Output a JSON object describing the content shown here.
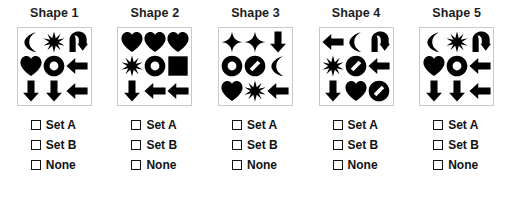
{
  "page": {
    "background_color": "#ffffff",
    "glyph_color": "#000000",
    "box_border_color": "#c9c9c9",
    "text_color": "#111111"
  },
  "option_labels": [
    "Set A",
    "Set B",
    "None"
  ],
  "columns": [
    {
      "title": "Shape 1",
      "glyphs": [
        "crescent-moon",
        "eight-point-star",
        "u-turn-arrow",
        "heart",
        "ring",
        "left-arrow",
        "down-arrow",
        "down-arrow",
        "left-arrow"
      ],
      "options": [
        {
          "label": "Set A",
          "checked": false
        },
        {
          "label": "Set B",
          "checked": false
        },
        {
          "label": "None",
          "checked": false
        }
      ]
    },
    {
      "title": "Shape 2",
      "glyphs": [
        "heart",
        "heart",
        "heart",
        "eight-point-star",
        "ring",
        "filled-square",
        "down-arrow",
        "left-arrow",
        "left-arrow"
      ],
      "options": [
        {
          "label": "Set A",
          "checked": false
        },
        {
          "label": "Set B",
          "checked": false
        },
        {
          "label": "None",
          "checked": false
        }
      ]
    },
    {
      "title": "Shape 3",
      "glyphs": [
        "four-point-sparkle",
        "four-point-sparkle",
        "down-arrow",
        "ring",
        "prohibition-sign",
        "crescent-moon",
        "heart",
        "eight-point-star",
        "left-arrow"
      ],
      "options": [
        {
          "label": "Set A",
          "checked": false
        },
        {
          "label": "Set B",
          "checked": false
        },
        {
          "label": "None",
          "checked": false
        }
      ]
    },
    {
      "title": "Shape 4",
      "glyphs": [
        "left-arrow",
        "crescent-moon",
        "u-turn-arrow",
        "eight-point-star",
        "prohibition-sign",
        "left-arrow",
        "down-arrow",
        "heart",
        "prohibition-sign"
      ],
      "options": [
        {
          "label": "Set A",
          "checked": false
        },
        {
          "label": "Set B",
          "checked": false
        },
        {
          "label": "None",
          "checked": false
        }
      ]
    },
    {
      "title": "Shape 5",
      "glyphs": [
        "crescent-moon",
        "eight-point-star",
        "u-turn-arrow",
        "heart",
        "ring",
        "left-arrow",
        "down-arrow",
        "down-arrow",
        "left-arrow"
      ],
      "options": [
        {
          "label": "Set A",
          "checked": false
        },
        {
          "label": "Set B",
          "checked": false
        },
        {
          "label": "None",
          "checked": false
        }
      ]
    }
  ]
}
